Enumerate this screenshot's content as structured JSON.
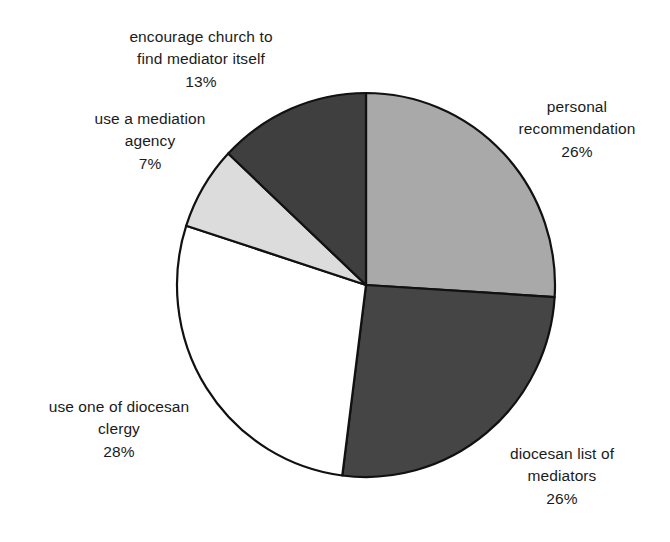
{
  "chart_data": {
    "type": "pie",
    "title": "",
    "subtitle": "",
    "xlabel": "",
    "ylabel": "",
    "legend_position": "none",
    "grid": false,
    "units": "%",
    "start_angle_deg": 0,
    "direction": "clockwise",
    "categories": [
      "personal recommendation",
      "diocesan list of mediators",
      "use one of diocesan clergy",
      "use a mediation agency",
      "encourage church to find mediator itself"
    ],
    "values": [
      26,
      26,
      28,
      7,
      13
    ],
    "labels": [
      "26%",
      "26%",
      "28%",
      "7%",
      "13%"
    ],
    "colors": [
      "#a9a9a9",
      "#454545",
      "#ffffff",
      "#dcdcdc",
      "#3f3f3f"
    ],
    "slices": [
      {
        "name": "personal recommendation",
        "value": 26,
        "percent_label": "26%",
        "color": "#a9a9a9",
        "start_deg": 0,
        "end_deg": 93.6,
        "label_lines": [
          "personal",
          "recommendation"
        ]
      },
      {
        "name": "diocesan list of mediators",
        "value": 26,
        "percent_label": "26%",
        "color": "#454545",
        "start_deg": 93.6,
        "end_deg": 187.2,
        "label_lines": [
          "diocesan list of",
          "mediators"
        ]
      },
      {
        "name": "use one of diocesan clergy",
        "value": 28,
        "percent_label": "28%",
        "color": "#ffffff",
        "start_deg": 187.2,
        "end_deg": 288.0,
        "label_lines": [
          "use one of diocesan",
          "clergy"
        ]
      },
      {
        "name": "use a mediation agency",
        "value": 7,
        "percent_label": "7%",
        "color": "#dcdcdc",
        "start_deg": 288.0,
        "end_deg": 313.2,
        "label_lines": [
          "use a mediation",
          "agency"
        ]
      },
      {
        "name": "encourage church to find mediator itself",
        "value": 13,
        "percent_label": "13%",
        "color": "#3f3f3f",
        "start_deg": 313.2,
        "end_deg": 360.0,
        "label_lines": [
          "encourage church to",
          "find mediator itself"
        ]
      }
    ]
  },
  "labels": {
    "encourage": {
      "line1": "encourage church to",
      "line2": "find mediator itself",
      "pct": "13%"
    },
    "agency": {
      "line1": "use a mediation",
      "line2": "agency",
      "pct": "7%"
    },
    "personal": {
      "line1": "personal",
      "line2": "recommendation",
      "pct": "26%"
    },
    "mediators": {
      "line1": "diocesan list of",
      "line2": "mediators",
      "pct": "26%"
    },
    "clergy": {
      "line1": "use one of diocesan",
      "line2": "clergy",
      "pct": "28%"
    }
  },
  "geometry": {
    "center_x": 366,
    "center_y": 285,
    "radius_x": 189,
    "radius_y": 192
  }
}
